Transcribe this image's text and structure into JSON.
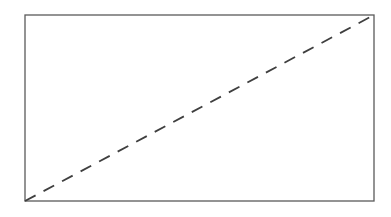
{
  "diagram": {
    "frame": {
      "x": 25,
      "y": 15,
      "width": 349,
      "height": 186,
      "stroke": "#5a5a5a",
      "stroke_width": 1.3
    },
    "diagonal": {
      "from": {
        "corner": "bottom-left",
        "x": 25,
        "y": 201
      },
      "to": {
        "corner": "top-right",
        "x": 374,
        "y": 15
      },
      "stroke": "#3f3f3f",
      "stroke_width": 1.8,
      "dash": 12,
      "gap": 9
    },
    "background": "#ffffff"
  }
}
